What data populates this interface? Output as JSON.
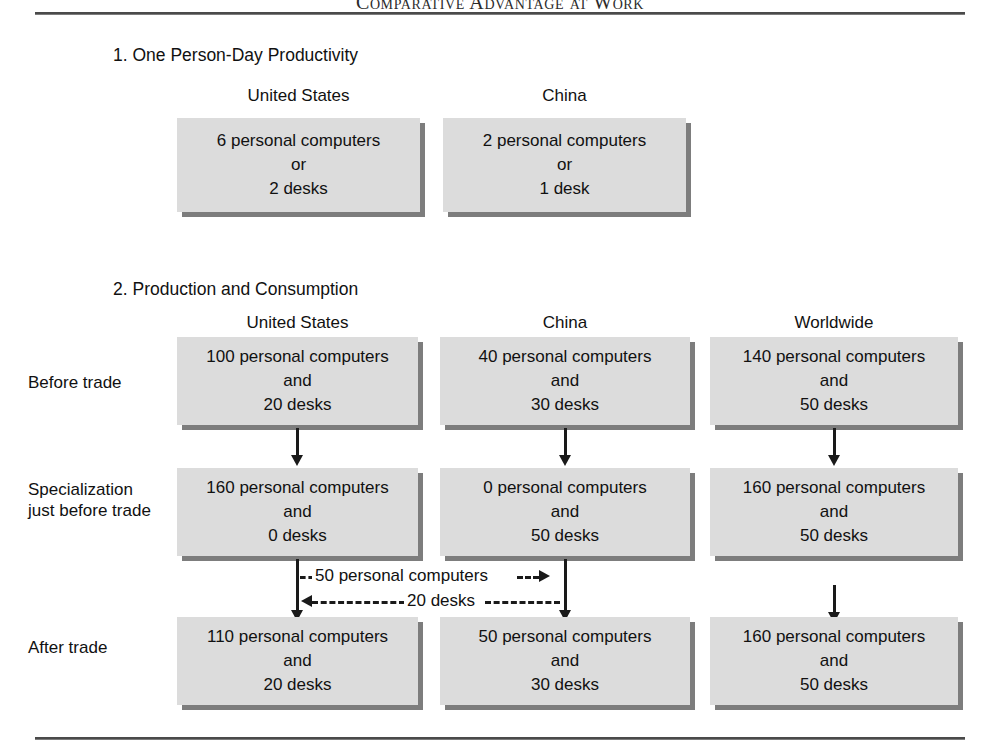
{
  "running_head": "Comparative Advantage at Work",
  "section1": {
    "title": "1. One Person-Day Productivity",
    "columns": [
      {
        "label": "United States"
      },
      {
        "label": "China"
      }
    ],
    "boxes": [
      {
        "lines": [
          "6 personal computers",
          "or",
          "2 desks"
        ]
      },
      {
        "lines": [
          "2 personal computers",
          "or",
          "1 desk"
        ]
      }
    ]
  },
  "section2": {
    "title": "2. Production and Consumption",
    "columns": [
      {
        "label": "United States"
      },
      {
        "label": "China"
      },
      {
        "label": "Worldwide"
      }
    ],
    "rows": [
      {
        "label": "Before trade",
        "cells": [
          {
            "lines": [
              "100 personal computers",
              "and",
              "20 desks"
            ]
          },
          {
            "lines": [
              "40 personal computers",
              "and",
              "30 desks"
            ]
          },
          {
            "lines": [
              "140 personal computers",
              "and",
              "50 desks"
            ]
          }
        ]
      },
      {
        "label": "Specialization just before trade",
        "cells": [
          {
            "lines": [
              "160 personal computers",
              "and",
              "0 desks"
            ]
          },
          {
            "lines": [
              "0 personal computers",
              "and",
              "50 desks"
            ]
          },
          {
            "lines": [
              "160 personal computers",
              "and",
              "50 desks"
            ]
          }
        ]
      },
      {
        "label": "After trade",
        "cells": [
          {
            "lines": [
              "110 personal computers",
              "and",
              "20 desks"
            ]
          },
          {
            "lines": [
              "50 personal computers",
              "and",
              "30 desks"
            ]
          },
          {
            "lines": [
              "160 personal computers",
              "and",
              "50 desks"
            ]
          }
        ]
      }
    ],
    "trade_flows": [
      {
        "label": "50 personal computers",
        "direction": "right"
      },
      {
        "label": "20 desks",
        "direction": "left"
      }
    ]
  },
  "colors": {
    "box_fill": "#dcdcdc",
    "box_shadow": "#7d7d7d",
    "ink": "#1a1a1a",
    "page": "#ffffff"
  }
}
